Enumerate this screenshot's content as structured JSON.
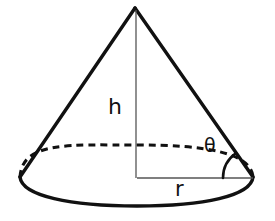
{
  "figure": {
    "kind": "geometry-diagram",
    "background_color": "#ffffff",
    "stroke_color": "#111111",
    "thin_stroke_color": "#555555",
    "width": 275,
    "height": 221
  },
  "labels": {
    "height": "h",
    "angle": "θ",
    "radius": "r"
  },
  "geometry": {
    "apex": {
      "x": 135,
      "y": 8
    },
    "base_center": {
      "x": 137,
      "y": 180
    },
    "base_rx": 117,
    "base_ry": 25,
    "left_base_point": {
      "x": 20,
      "y": 177
    },
    "right_base_point": {
      "x": 253,
      "y": 177
    },
    "axis_line": {
      "x1": 136,
      "y1": 10,
      "x2": 136,
      "y2": 178
    },
    "radius_line": {
      "x1": 137,
      "y1": 178,
      "x2": 253,
      "y2": 178
    },
    "angle_arc_radius": 30,
    "dash_pattern": "7 5"
  },
  "parts": {
    "apex_name": "cone-apex",
    "left_slant_name": "left-slant-edge",
    "right_slant_name": "right-slant-edge",
    "front_base_arc_name": "base-front-arc",
    "back_base_arc_name": "base-back-arc-dashed",
    "height_line_name": "height-axis-line",
    "radius_line_name": "radius-line",
    "angle_arc_name": "angle-arc"
  }
}
